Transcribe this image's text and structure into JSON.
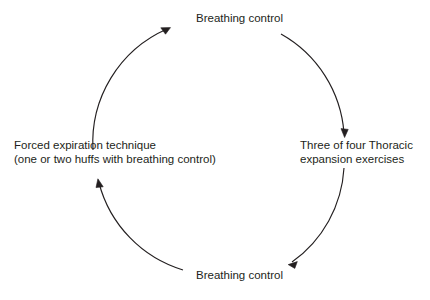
{
  "diagram": {
    "type": "cycle",
    "direction": "clockwise",
    "stroke_color": "#231f20",
    "background_color": "#ffffff",
    "nodes": [
      {
        "id": "top",
        "position": "top",
        "text": "Breathing control"
      },
      {
        "id": "right",
        "position": "right",
        "line1": "Three of four Thoracic",
        "line2": "expansion exercises"
      },
      {
        "id": "bottom",
        "position": "bottom",
        "text": "Breathing control"
      },
      {
        "id": "left",
        "position": "left",
        "line1": "Forced expiration technique",
        "line2": "(one or two huffs with breathing control)"
      }
    ],
    "arrows": [
      {
        "id": "left-to-top",
        "from": "left",
        "to": "top"
      },
      {
        "id": "top-to-right",
        "from": "top",
        "to": "right"
      },
      {
        "id": "right-to-bottom",
        "from": "right",
        "to": "bottom"
      },
      {
        "id": "bottom-to-left",
        "from": "bottom",
        "to": "left"
      }
    ]
  }
}
